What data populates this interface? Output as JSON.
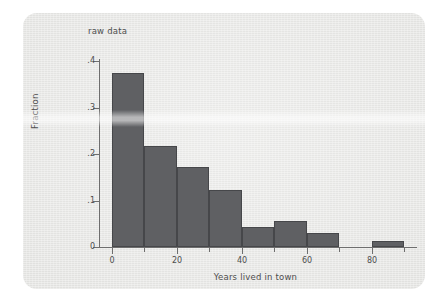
{
  "chart_data": {
    "type": "bar",
    "title": "raw data",
    "xlabel": "Years lived in town",
    "ylabel": "Fraction",
    "xlim": [
      -4,
      94
    ],
    "ylim": [
      0,
      0.4
    ],
    "grid": false,
    "legend": null,
    "bin_width": 10,
    "bin_starts": [
      0,
      10,
      20,
      30,
      40,
      50,
      60,
      80
    ],
    "categories": [
      "0-10",
      "10-20",
      "20-30",
      "30-40",
      "40-50",
      "50-60",
      "60-70",
      "80-90"
    ],
    "values": [
      0.375,
      0.217,
      0.173,
      0.122,
      0.043,
      0.056,
      0.03,
      0.012
    ],
    "x_ticks": [
      {
        "value": 0,
        "label": "0",
        "major": true
      },
      {
        "value": 10,
        "label": "",
        "major": false
      },
      {
        "value": 20,
        "label": "20",
        "major": true
      },
      {
        "value": 30,
        "label": "",
        "major": false
      },
      {
        "value": 40,
        "label": "40",
        "major": true
      },
      {
        "value": 50,
        "label": "",
        "major": false
      },
      {
        "value": 60,
        "label": "60",
        "major": true
      },
      {
        "value": 70,
        "label": "",
        "major": false
      },
      {
        "value": 80,
        "label": "80",
        "major": true
      },
      {
        "value": 90,
        "label": "",
        "major": false
      }
    ],
    "y_ticks": [
      {
        "value": 0,
        "label": "0"
      },
      {
        "value": 0.1,
        "label": ".1"
      },
      {
        "value": 0.2,
        "label": ".2"
      },
      {
        "value": 0.3,
        "label": ".3"
      },
      {
        "value": 0.4,
        "label": ".4"
      }
    ],
    "colors": {
      "bar_fill": "#5f6063",
      "bar_border": "#46474a",
      "axis": "#6e6e6e",
      "text": "#4d4d4d",
      "panel_background": "#e9e9e7",
      "page_background": "#ffffff"
    }
  }
}
